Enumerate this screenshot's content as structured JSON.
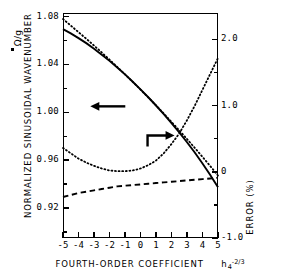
{
  "chart_data": {
    "type": "line",
    "title": "",
    "xlabel": "FOURTH-ORDER COEFFICIENT",
    "xlabel_symbol_base": "h",
    "xlabel_symbol_sub": "4",
    "xlabel_symbol_sup": "-2/3",
    "ylabel": "NORMALIZED SINUSOIDAL WAVENUMBER",
    "ylabel_unit": "Ω/g",
    "y2label": "ERROR  (%)",
    "xlim": [
      -5,
      5
    ],
    "ylim": [
      0.895,
      1.083
    ],
    "y2lim": [
      -1.0,
      2.4
    ],
    "grid": false,
    "legend": "none",
    "x_ticks": [
      -5,
      -4,
      -3,
      -2,
      -1,
      0,
      1,
      2,
      3,
      4,
      5
    ],
    "x_tick_labels": [
      "-5",
      "-4",
      "-3",
      "-2",
      "-1",
      "0",
      "1",
      "2",
      "3",
      "4",
      "5"
    ],
    "y_ticks": [
      1.08,
      1.04,
      1.0,
      0.96,
      0.92
    ],
    "y_tick_labels": [
      "1.08",
      "1.04",
      "1.00",
      "0.96",
      "0.92"
    ],
    "y_minor_ticks": [
      1.06,
      1.02,
      0.98,
      0.94,
      0.9
    ],
    "y2_ticks": [
      2.0,
      1.0,
      0,
      -1.0
    ],
    "y2_tick_labels": [
      "2.0",
      "1.0",
      "0",
      "-1.0"
    ],
    "y2_minor_ticks": [
      1.5,
      0.5,
      -0.5
    ],
    "annotations": [
      {
        "name": "left-arrow",
        "text": "←",
        "points_to": "left-axis",
        "x": -2.4,
        "y": 1.005
      },
      {
        "name": "right-arrow",
        "text": "→",
        "points_to": "right-axis",
        "x": 1.1,
        "y2": 0.55
      }
    ],
    "series": [
      {
        "name": "wavenumber-exact",
        "style": "solid",
        "axis": "left",
        "x": [
          -5,
          -4.5,
          -4,
          -3.5,
          -3,
          -2.5,
          -2,
          -1.5,
          -1,
          -0.5,
          0,
          0.5,
          1,
          1.5,
          2,
          2.5,
          3,
          3.5,
          4,
          4.5,
          5
        ],
        "y": [
          1.0695,
          1.066,
          1.062,
          1.0578,
          1.0532,
          1.0482,
          1.043,
          1.0375,
          1.0317,
          1.0256,
          1.0192,
          1.0126,
          1.0057,
          0.9985,
          0.991,
          0.9832,
          0.975,
          0.9664,
          0.9573,
          0.9477,
          0.9375
        ]
      },
      {
        "name": "wavenumber-approx",
        "style": "dotted",
        "axis": "left",
        "x": [
          -5,
          -4.5,
          -4,
          -3.5,
          -3,
          -2.5,
          -2,
          -1.5,
          -1,
          -0.5,
          0,
          0.5,
          1,
          1.5,
          2,
          2.5,
          3,
          3.5,
          4,
          4.5,
          5
        ],
        "y": [
          1.078,
          1.0725,
          1.067,
          1.0615,
          1.0558,
          1.05,
          1.044,
          1.0379,
          1.0317,
          1.0254,
          1.019,
          1.0125,
          1.0058,
          0.999,
          0.992,
          0.9849,
          0.9777,
          0.9703,
          0.9628,
          0.9551,
          0.9472
        ]
      },
      {
        "name": "error-approx",
        "style": "dotted",
        "axis": "right",
        "x": [
          -5,
          -4.5,
          -4,
          -3.5,
          -3,
          -2.5,
          -2,
          -1.5,
          -1,
          -0.5,
          0,
          0.5,
          1,
          1.5,
          2,
          2.5,
          3,
          3.5,
          4,
          4.5,
          5
        ],
        "y2": [
          0.36,
          0.28,
          0.2,
          0.14,
          0.09,
          0.05,
          0.02,
          0.01,
          0.01,
          0.02,
          0.05,
          0.1,
          0.17,
          0.28,
          0.42,
          0.58,
          0.78,
          1.0,
          1.24,
          1.48,
          1.72
        ]
      },
      {
        "name": "error-exact",
        "style": "dashed",
        "axis": "right",
        "x": [
          -5,
          -4.5,
          -4,
          -3.5,
          -3,
          -2.5,
          -2,
          -1.5,
          -1,
          -0.5,
          0,
          0.5,
          1,
          1.5,
          2,
          2.5,
          3,
          3.5,
          4,
          4.5,
          5
        ],
        "y2": [
          -0.38,
          -0.35,
          -0.32,
          -0.3,
          -0.28,
          -0.26,
          -0.24,
          -0.22,
          -0.21,
          -0.2,
          -0.19,
          -0.18,
          -0.17,
          -0.16,
          -0.15,
          -0.14,
          -0.13,
          -0.12,
          -0.11,
          -0.1,
          -0.09
        ]
      }
    ]
  }
}
